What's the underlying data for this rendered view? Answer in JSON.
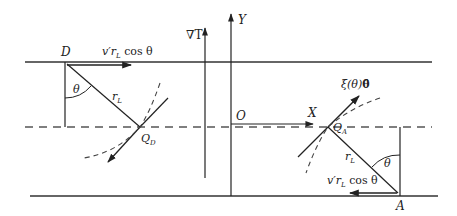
{
  "figure": {
    "labels": {
      "D": "D",
      "A": "A",
      "O": "O",
      "X": "X",
      "Y": "Y",
      "gradT": "∇T",
      "theta": "θ",
      "rL": "r",
      "rL_sub": "L",
      "QD": "Q",
      "QD_sub": "D",
      "QA": "Q",
      "QA_sub": "A",
      "velocity_top": "v′r",
      "velocity_top_sub": "L",
      "velocity_top_rest": " cos θ",
      "velocity_bottom": "v′r",
      "velocity_bottom_sub": "L",
      "velocity_bottom_rest": " cos θ",
      "xi": "ξ(θ)",
      "theta_hat": "θ̂"
    },
    "colors": {
      "stroke": "#2a2a2a",
      "dashed": "#555555",
      "background": "#ffffff"
    }
  }
}
